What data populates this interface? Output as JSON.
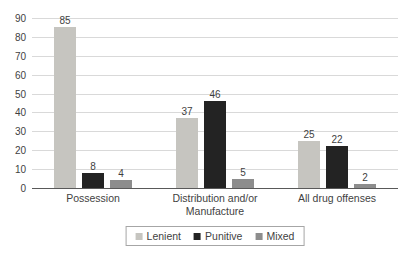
{
  "chart_data": {
    "type": "bar",
    "title": "",
    "categories": [
      "Possession",
      "Distribution and/or Manufacture",
      "All drug offenses"
    ],
    "series": [
      {
        "name": "Lenient",
        "values": [
          85,
          37,
          25
        ],
        "color": "#c6c5c0"
      },
      {
        "name": "Punitive",
        "values": [
          8,
          46,
          22
        ],
        "color": "#232323"
      },
      {
        "name": "Mixed",
        "values": [
          4,
          5,
          2
        ],
        "color": "#8d8d8d"
      }
    ],
    "yticks": [
      0,
      10,
      20,
      30,
      40,
      50,
      60,
      70,
      80,
      90
    ],
    "ylim": [
      0,
      90
    ],
    "grid": true,
    "data_labels": true,
    "legend_position": "bottom",
    "colors": {
      "gridline": "#d9d9d9",
      "axis_line": "#595959",
      "text": "#3f3f3f",
      "legend_border": "#a6a6a6"
    }
  }
}
